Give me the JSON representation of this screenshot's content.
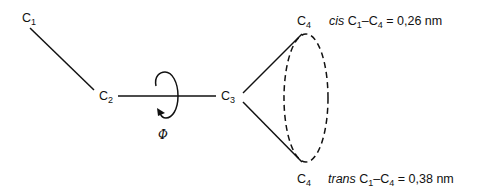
{
  "diagram": {
    "atoms": [
      {
        "id": "C1",
        "symbol": "C",
        "subscript": "1"
      },
      {
        "id": "C2",
        "symbol": "C",
        "subscript": "2"
      },
      {
        "id": "C3",
        "symbol": "C",
        "subscript": "3"
      },
      {
        "id": "C4_cis",
        "symbol": "C",
        "subscript": "4"
      },
      {
        "id": "C4_trans",
        "symbol": "C",
        "subscript": "4"
      }
    ],
    "rotation_symbol": "Φ",
    "cis": {
      "word": "cis",
      "a_symbol": "C",
      "a_sub": "1",
      "dash": "–",
      "b_symbol": "C",
      "b_sub": "4",
      "equals": " = ",
      "value": "0,26 nm"
    },
    "trans": {
      "word": "trans",
      "a_symbol": "C",
      "a_sub": "1",
      "dash": "–",
      "b_symbol": "C",
      "b_sub": "4",
      "equals": " = ",
      "value": "0,38 nm"
    },
    "colors": {
      "line": "#111111",
      "background": "#ffffff"
    }
  }
}
